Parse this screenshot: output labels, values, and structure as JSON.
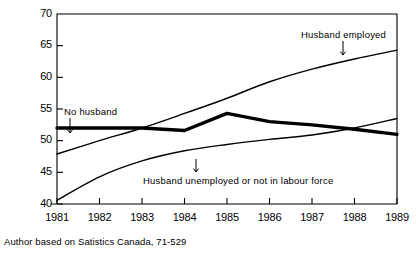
{
  "figure": {
    "source_note": "Author based on Satistics Canada, 71-529",
    "background_color": "#ffffff",
    "line_color": "#000000"
  },
  "chart_data": {
    "type": "line",
    "title": "",
    "subtitle": "",
    "xlabel": "",
    "ylabel": "% in labour force by status of husband",
    "xlim": [
      1981,
      1989
    ],
    "ylim": [
      40,
      70
    ],
    "grid": false,
    "legend_position": "inline-annotations",
    "x": [
      1981,
      1982,
      1983,
      1984,
      1985,
      1986,
      1987,
      1988,
      1989
    ],
    "xticks": [
      "1981",
      "1982",
      "1983",
      "1984",
      "1985",
      "1986",
      "1987",
      "1988",
      "1989"
    ],
    "yticks": [
      40,
      45,
      50,
      55,
      60,
      65,
      70
    ],
    "series": [
      {
        "name": "Husband employed",
        "style": "thin",
        "values": [
          47.9,
          50.0,
          52.0,
          54.3,
          56.7,
          59.3,
          61.3,
          62.9,
          64.3
        ]
      },
      {
        "name": "No husband",
        "style": "thick",
        "values": [
          52.0,
          52.0,
          52.0,
          51.6,
          54.3,
          53.0,
          52.5,
          51.8,
          51.0
        ]
      },
      {
        "name": "Husband unemployed or not in labour force",
        "style": "thin",
        "values": [
          40.6,
          44.3,
          46.8,
          48.4,
          49.4,
          50.2,
          50.9,
          52.0,
          53.5
        ]
      }
    ],
    "annotations": [
      {
        "id": "husband-employed",
        "text": "Husband employed",
        "x_px": 301,
        "y_px": 29,
        "arrow_x_px": 343,
        "arrow_y_top_px": 41,
        "arrow_y_bottom_px": 55
      },
      {
        "id": "no-husband",
        "text": "No husband",
        "x_px": 64,
        "y_px": 106,
        "arrow_x_px": 70,
        "arrow_y_top_px": 118,
        "arrow_y_bottom_px": 133
      },
      {
        "id": "husband-unemployed",
        "text": "Husband unemployed or not in labour force",
        "x_px": 143,
        "y_px": 175,
        "arrow_x_px": 196,
        "arrow_y_top_px": 159,
        "arrow_y_bottom_px": 172
      }
    ]
  }
}
